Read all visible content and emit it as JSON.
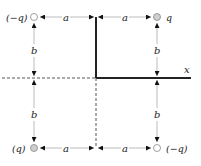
{
  "diagram": {
    "charges": [
      {
        "id": "top-left",
        "label": "(−q)",
        "sign": "negative",
        "fill": "#ffffff"
      },
      {
        "id": "top-right",
        "label": "q",
        "sign": "positive",
        "fill": "#cfcfcf"
      },
      {
        "id": "bottom-left",
        "label": "(q)",
        "sign": "positive",
        "fill": "#cfcfcf"
      },
      {
        "id": "bottom-right",
        "label": "(−q)",
        "sign": "negative",
        "fill": "#ffffff"
      }
    ],
    "distances": {
      "horizontal": "a",
      "vertical": "b"
    },
    "axis": {
      "x_label": "x"
    },
    "colors": {
      "conductor": "#222222",
      "dimension_line": "#bbbbbb",
      "dashed_line": "#555555",
      "positive_charge": "#cfcfcf",
      "negative_charge": "#ffffff"
    }
  }
}
